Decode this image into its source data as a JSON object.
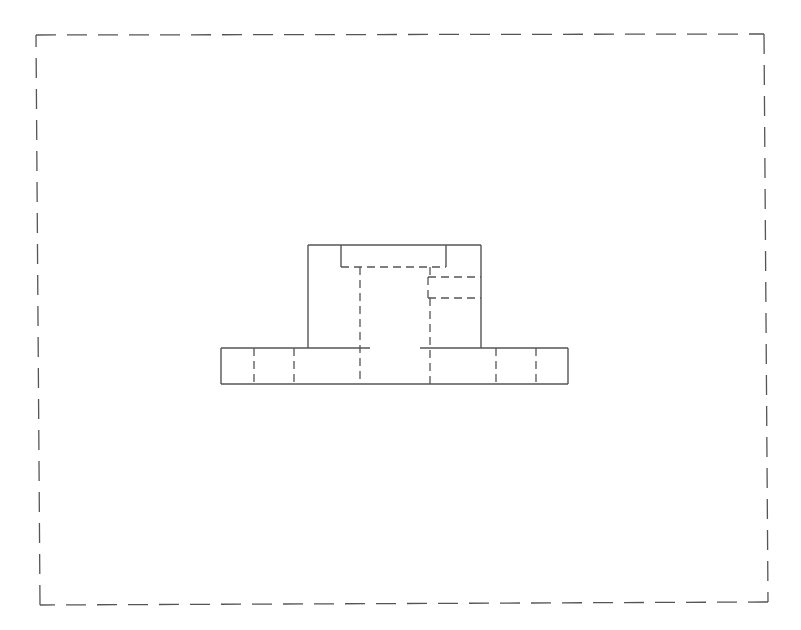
{
  "drawing": {
    "type": "orthographic-front-view",
    "line_color": "#555555",
    "background": "#ffffff",
    "frame": {
      "style": "dashed",
      "corners": {
        "tl": [
          36,
          35
        ],
        "tr": [
          764,
          34
        ],
        "br": [
          768,
          602
        ],
        "bl": [
          40,
          605
        ]
      }
    },
    "base_plate": {
      "x1": 221,
      "y_top": 348,
      "x2": 568,
      "y_bottom": 384,
      "top_gap": [
        370,
        420
      ],
      "hidden_holes_x": [
        254,
        294,
        496,
        536
      ]
    },
    "upper_block": {
      "x1": 308,
      "y_top": 245,
      "x2": 481,
      "y_bottom": 348
    },
    "top_slot": {
      "x1": 341,
      "x2": 446,
      "y_bottom": 267
    },
    "center_bore_hidden": {
      "x_left": 360,
      "x_right": 430,
      "y_top": 267,
      "y_bottom": 384
    },
    "side_hole_hidden": {
      "x1": 428,
      "x2": 481,
      "y_top": 277,
      "y_bottom": 298
    }
  }
}
